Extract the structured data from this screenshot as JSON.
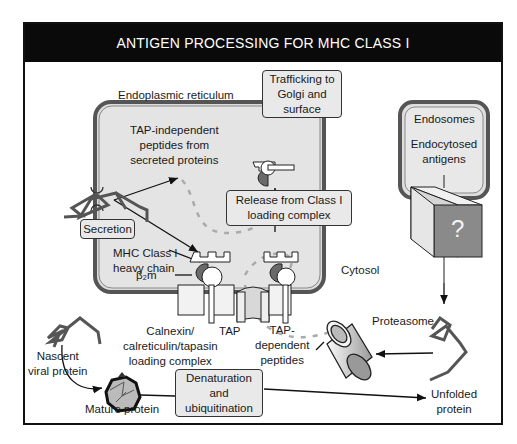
{
  "title": "ANTIGEN PROCESSING FOR MHC CLASS I",
  "compartments": {
    "er": "Endoplasmic reticulum",
    "endosomes": "Endosomes",
    "cytosol": "Cytosol"
  },
  "boxes": {
    "trafficking": [
      "Trafficking to",
      "Golgi and",
      "surface"
    ],
    "release": [
      "Release from Class I",
      "loading complex"
    ],
    "secretion": [
      "Secretion"
    ],
    "denaturation": [
      "Denaturation",
      "and",
      "ubiquitination"
    ]
  },
  "labels": {
    "tap_independent": [
      "TAP-independent",
      "peptides from",
      "secreted proteins"
    ],
    "endocytosed": [
      "Endocytosed",
      "antigens"
    ],
    "question": "?",
    "mhc_heavy": [
      "MHC Class I",
      "heavy chain"
    ],
    "b2m": "β₂m",
    "calnexin": [
      "Calnexin/",
      "calreticulin/tapasin",
      "loading complex"
    ],
    "tap": "TAP",
    "tap_dependent": [
      "TAP-",
      "dependent",
      "peptides"
    ],
    "proteasome": "Proteasome",
    "nascent": [
      "Nascent",
      "viral protein"
    ],
    "mature": "Mature protein",
    "unfolded": [
      "Unfolded",
      "protein"
    ]
  },
  "colors": {
    "header_bg": "#0a0a0a",
    "er_fill": "#dcdcdc",
    "box_fill": "#e9e9e9",
    "dark_gray": "#6a6a6a",
    "cube_front": "#8a8a8a"
  }
}
